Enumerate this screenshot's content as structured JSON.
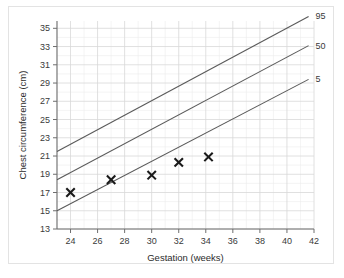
{
  "chart_data": {
    "type": "line",
    "title": "",
    "xlabel": "Gestation (weeks)",
    "ylabel": "Chest circumference (cm)",
    "xlim": [
      23,
      42
    ],
    "ylim": [
      13,
      35.8
    ],
    "xticks": [
      24,
      26,
      28,
      30,
      32,
      34,
      36,
      38,
      40,
      42
    ],
    "yticks": [
      13,
      15,
      17,
      19,
      21,
      23,
      25,
      27,
      29,
      31,
      33,
      35
    ],
    "grid": true,
    "grid_minor": true,
    "legend_position": "right-inline-end-of-line",
    "series": [
      {
        "name": "95",
        "label": "95",
        "kind": "percentile-line",
        "x": [
          23,
          41.6
        ],
        "values": [
          21.5,
          36.3
        ]
      },
      {
        "name": "50",
        "label": "50",
        "kind": "percentile-line",
        "x": [
          23,
          41.6
        ],
        "values": [
          18.4,
          33.1
        ]
      },
      {
        "name": "5",
        "label": "5",
        "kind": "percentile-line",
        "x": [
          23,
          41.6
        ],
        "values": [
          15.0,
          29.4
        ]
      },
      {
        "name": "measurements",
        "label": "",
        "kind": "scatter-x-marker",
        "x": [
          24.0,
          27.0,
          30.0,
          32.0,
          34.2
        ],
        "values": [
          17.0,
          18.4,
          18.9,
          20.3,
          20.9
        ]
      }
    ],
    "colors": {
      "line": "#5a5a5a",
      "marker": "#1a1a1a",
      "grid_major": "#d8d8d8",
      "grid_minor": "#ececec",
      "axis": "#6e6e6e",
      "text": "#3a3a3a",
      "background": "#ffffff",
      "card_border": "#e3e3e3"
    }
  }
}
